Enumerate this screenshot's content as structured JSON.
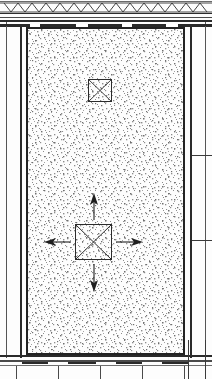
{
  "drawing": {
    "title": "Structural section — stipple-hatched chamber",
    "type": "architectural-section",
    "canvas": {
      "width": 212,
      "height": 379
    },
    "background_color": "#fdfdfd",
    "line_color": "#2a2a2a",
    "hatch_color": "#9a9a9a"
  },
  "top_assembly": {
    "name": "joist-truss-band",
    "label": "",
    "truss_count": 13,
    "truss_shape": "vee",
    "band_height_px": 22,
    "rule_lines": 4
  },
  "chamber": {
    "name": "hatched-fill-region",
    "label": "",
    "hatch_pattern": "stipple",
    "x": 27,
    "y": 28,
    "width": 157,
    "height": 326,
    "outline_width_px": 2
  },
  "walls": {
    "left": {
      "label": "",
      "outer_x": 6,
      "inner_x": 20
    },
    "right": {
      "label": "",
      "outer_x": 205,
      "inner_x": 190
    },
    "tick_marks": 2
  },
  "footing": {
    "name": "bottom-footing-band",
    "label": "",
    "rule_lines": 3,
    "dash_segments": 4,
    "vertical_ticks": 5
  },
  "elements": [
    {
      "id": "upper-xbox",
      "name": "x-box-upper",
      "label": "",
      "x": 88,
      "y": 79,
      "width": 24,
      "height": 23,
      "has_diagonals": true,
      "arrows": []
    },
    {
      "id": "main-xbox",
      "name": "x-box-main",
      "label": "",
      "x": 75,
      "y": 224,
      "width": 37,
      "height": 36,
      "has_diagonals": true,
      "arrows": [
        "up",
        "right",
        "down",
        "left"
      ]
    }
  ],
  "arrows": {
    "up": {
      "label": "",
      "dir": "up",
      "x1": 94,
      "y1": 218,
      "x2": 94,
      "y2": 196
    },
    "down": {
      "label": "",
      "dir": "down",
      "x1": 94,
      "y1": 266,
      "x2": 94,
      "y2": 290
    },
    "left": {
      "label": "",
      "dir": "left",
      "x1": 69,
      "y1": 242,
      "x2": 44,
      "y2": 242
    },
    "right": {
      "label": "",
      "dir": "right",
      "x1": 118,
      "y1": 242,
      "x2": 143,
      "y2": 242
    }
  }
}
